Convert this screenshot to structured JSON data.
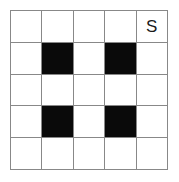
{
  "puzzle": {
    "title": "5x5 Black-and-White Cell Grid",
    "rows": 5,
    "columns": 5,
    "colors": {
      "background": "#ffffff",
      "grid_line": "#888888",
      "filled_cell": "#0a0a0a",
      "empty_cell": "#ffffff",
      "label_text": "#1a1a1a"
    },
    "cells": [
      [
        {
          "state": "empty",
          "label": ""
        },
        {
          "state": "empty",
          "label": ""
        },
        {
          "state": "empty",
          "label": ""
        },
        {
          "state": "empty",
          "label": ""
        },
        {
          "state": "empty",
          "label": "S"
        }
      ],
      [
        {
          "state": "empty",
          "label": ""
        },
        {
          "state": "filled",
          "label": ""
        },
        {
          "state": "empty",
          "label": ""
        },
        {
          "state": "filled",
          "label": ""
        },
        {
          "state": "empty",
          "label": ""
        }
      ],
      [
        {
          "state": "empty",
          "label": ""
        },
        {
          "state": "empty",
          "label": ""
        },
        {
          "state": "empty",
          "label": ""
        },
        {
          "state": "empty",
          "label": ""
        },
        {
          "state": "empty",
          "label": ""
        }
      ],
      [
        {
          "state": "empty",
          "label": ""
        },
        {
          "state": "filled",
          "label": ""
        },
        {
          "state": "empty",
          "label": ""
        },
        {
          "state": "filled",
          "label": ""
        },
        {
          "state": "empty",
          "label": ""
        }
      ],
      [
        {
          "state": "empty",
          "label": ""
        },
        {
          "state": "empty",
          "label": ""
        },
        {
          "state": "empty",
          "label": ""
        },
        {
          "state": "empty",
          "label": ""
        },
        {
          "state": "empty",
          "label": ""
        }
      ]
    ]
  }
}
